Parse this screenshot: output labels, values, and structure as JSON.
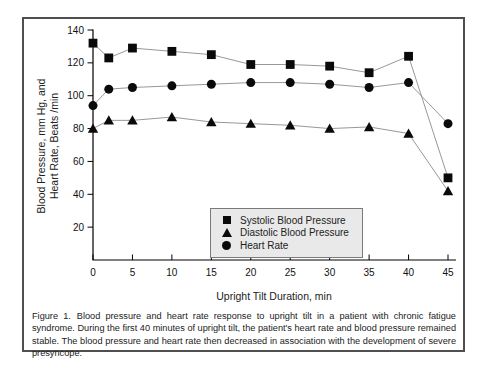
{
  "figure": {
    "caption_label": "Figure 1.",
    "caption_text": "Blood pressure and heart rate response to upright tilt in a patient with chronic fatigue syndrome. During the first 40 minutes of upright tilt, the patient's heart rate and blood pressure remained stable. The blood pressure and heart rate then decreased in association with the development of severe presyncope."
  },
  "chart_data": {
    "type": "line",
    "x": [
      0,
      2,
      5,
      10,
      15,
      20,
      25,
      30,
      35,
      40,
      45
    ],
    "series": [
      {
        "name": "Systolic Blood Pressure",
        "marker": "square",
        "values": [
          132,
          123,
          129,
          127,
          125,
          119,
          119,
          118,
          114,
          124,
          50
        ]
      },
      {
        "name": "Diastolic Blood Pressure",
        "marker": "triangle",
        "values": [
          80,
          85,
          85,
          87,
          84,
          83,
          82,
          80,
          81,
          77,
          42
        ]
      },
      {
        "name": "Heart Rate",
        "marker": "circle",
        "values": [
          94,
          104,
          105,
          106,
          107,
          108,
          108,
          107,
          105,
          108,
          83
        ]
      }
    ],
    "xlabel": "Upright Tilt Duration, min",
    "ylabel_line1": "Blood Pressure, mm Hg, and",
    "ylabel_line2": "Heart Rate, Beats /min",
    "xlim": [
      0,
      45
    ],
    "ylim": [
      0,
      140
    ],
    "x_ticks": [
      0,
      5,
      10,
      15,
      20,
      25,
      30,
      35,
      40,
      45
    ],
    "y_ticks": [
      20,
      40,
      60,
      80,
      100,
      120,
      140
    ],
    "grid": false,
    "legend_position": "inside-bottom-center",
    "colors": {
      "marker": "#0a0a0a",
      "line": "#8c8c8c",
      "axis": "#000000"
    }
  }
}
